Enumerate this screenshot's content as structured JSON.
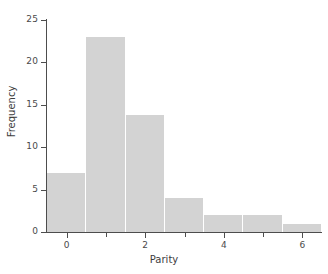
{
  "chart_data": {
    "type": "bar",
    "title": "",
    "subtitle": "",
    "xlabel": "Parity",
    "ylabel": "Frequency",
    "categories": [
      "0",
      "1",
      "2",
      "3",
      "4",
      "5",
      "6"
    ],
    "values": [
      7,
      23,
      13.8,
      4,
      2,
      2,
      1
    ],
    "x": [
      0,
      1,
      2,
      3,
      4,
      5,
      6
    ],
    "bin_edges": [
      -0.5,
      0.5,
      1.5,
      2.5,
      3.5,
      4.5,
      5.5,
      6.5
    ],
    "xlim": [
      -0.5,
      6.5
    ],
    "ylim": [
      0,
      25
    ],
    "xticks": [
      0,
      2,
      4,
      6
    ],
    "xtick_labels": [
      "0",
      "2",
      "4",
      "6"
    ],
    "xminor_ticks": [
      1,
      3,
      5
    ],
    "yticks": [
      0,
      5,
      10,
      15,
      20,
      25
    ],
    "ytick_labels": [
      "0",
      "5",
      "10",
      "15",
      "20",
      "25"
    ],
    "grid": false,
    "legend": "none",
    "bar_color": "#d3d3d3",
    "axis_color": "#4d4d4d",
    "text_color": "#4a4a4a",
    "background_color": "#ffffff",
    "annotations": []
  }
}
